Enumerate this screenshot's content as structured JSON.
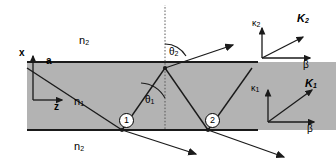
{
  "figure": {
    "slab_color": "#b3b3b3",
    "line_color": "#1a1a1a",
    "background": "#ffffff"
  },
  "media": {
    "upper_label": "n",
    "upper_sub": "2",
    "core_label": "n",
    "core_sub": "1",
    "lower_label": "n",
    "lower_sub": "2"
  },
  "axes": {
    "x_label": "x",
    "z_label": "z",
    "thickness_label": "a"
  },
  "angles": {
    "theta_out_label": "θ",
    "theta_out_sub": "2",
    "theta_in_label": "θ",
    "theta_in_sub": "1"
  },
  "bounce_points": [
    {
      "label": "1"
    },
    {
      "label": "2"
    }
  ],
  "vector_diagrams": [
    {
      "name": "upper",
      "vertical_axis_label": "κ",
      "vertical_axis_sub": "2",
      "resultant_label": "K",
      "resultant_sub": "2",
      "horizontal_axis_label": "β"
    },
    {
      "name": "lower",
      "vertical_axis_label": "κ",
      "vertical_axis_sub": "1",
      "resultant_label": "K",
      "resultant_sub": "1",
      "horizontal_axis_label": "β"
    }
  ]
}
